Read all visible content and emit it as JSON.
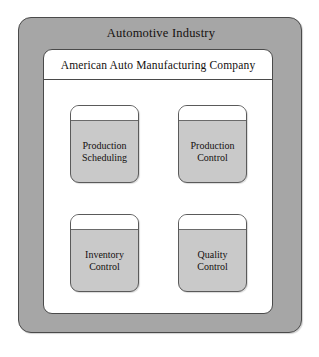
{
  "diagram": {
    "industry": {
      "title": "Automotive Industry"
    },
    "company": {
      "title": "American Auto Manufacturing Company"
    },
    "functions": [
      {
        "line1": "Production",
        "line2": "Scheduling",
        "label": "Production Scheduling"
      },
      {
        "line1": "Production",
        "line2": "Control",
        "label": "Production Control"
      },
      {
        "line1": "Inventory",
        "line2": "Control",
        "label": "Inventory Control"
      },
      {
        "line1": "Quality",
        "line2": "Control",
        "label": "Quality Control"
      }
    ],
    "colors": {
      "industry_frame_fill": "#a6a6a6",
      "company_box_fill": "#ffffff",
      "function_box_fill": "#c9c9c9",
      "function_box_lid_fill": "#ffffff",
      "border": "#4a4a4a",
      "text": "#14100f",
      "page_background": "#ffffff"
    }
  }
}
